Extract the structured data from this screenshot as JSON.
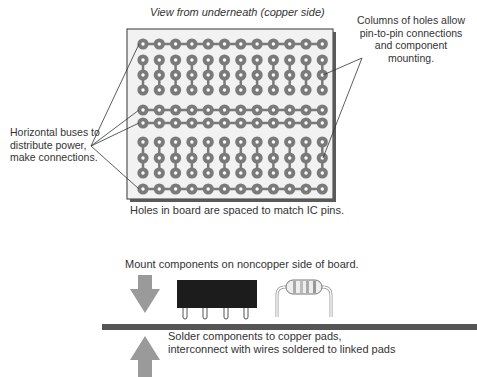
{
  "diagram": {
    "title": "View from underneath (copper side)",
    "annotations": {
      "columns": "Columns of holes allow pin-to-pin connections and component mounting.",
      "buses": "Horizontal buses to distribute power, make connections.",
      "spacing": "Holes in board are spaced to match IC pins.",
      "mount": "Mount components on noncopper side of board.",
      "solder_line1": "Solder components to copper pads,",
      "solder_line2": "interconnect with wires soldered to linked pads"
    },
    "board": {
      "columns": 12,
      "rows": [
        "bus",
        "hole",
        "hole",
        "hole",
        "bus",
        "bus",
        "hole",
        "hole",
        "hole",
        "bus"
      ],
      "column_groups": [
        [
          1,
          3
        ],
        [
          6,
          8
        ]
      ]
    },
    "colors": {
      "board_fill": "#f2f2f2",
      "pad": "#7a7a7a",
      "board_edge": "#555555",
      "arrow": "#9a9a9a",
      "ic": "#1c1c1c",
      "pcb_side": "#555555"
    },
    "components": [
      "ic-dip-package",
      "resistor"
    ]
  }
}
